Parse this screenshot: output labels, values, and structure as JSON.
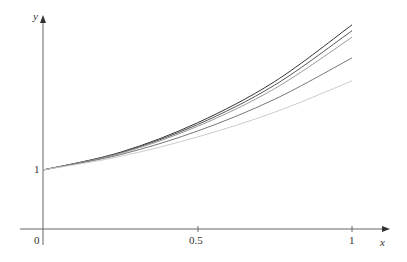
{
  "chart_data": {
    "type": "line",
    "title": "",
    "xlabel": "x",
    "ylabel": "y",
    "x_ticks": [
      "0",
      "0.5",
      "1"
    ],
    "y_ticks": [
      "1"
    ],
    "xlim": [
      0,
      1.1
    ],
    "grid": false,
    "legend": null,
    "x": [
      0,
      0.25,
      0.5,
      0.75,
      1
    ],
    "series": [
      {
        "name": "curve 1 (darkest, highest)",
        "color": "#333333",
        "values": [
          1,
          1.3,
          1.8,
          2.5,
          3.46
        ]
      },
      {
        "name": "curve 2",
        "color": "#555555",
        "values": [
          1,
          1.29,
          1.77,
          2.44,
          3.36
        ]
      },
      {
        "name": "curve 3",
        "color": "#999999",
        "values": [
          1,
          1.28,
          1.74,
          2.38,
          3.25
        ]
      },
      {
        "name": "curve 4",
        "color": "#777777",
        "values": [
          1,
          1.26,
          1.66,
          2.2,
          2.9
        ]
      },
      {
        "name": "curve 5 (lightest, lowest)",
        "color": "#cccccc",
        "values": [
          1,
          1.23,
          1.56,
          1.98,
          2.51
        ]
      }
    ]
  },
  "axes": {
    "x_label": "x",
    "y_label": "y",
    "origin": "0",
    "x_mid": "0.5",
    "x_end": "1",
    "y_one": "1"
  }
}
